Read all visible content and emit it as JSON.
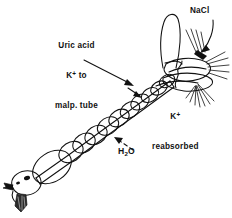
{
  "figure": {
    "background_color": "#ffffff",
    "ink_color": "#111111"
  },
  "labels": {
    "uric_acid": {
      "line1": "Uric acid",
      "line2_ion": "K",
      "line2_charge": "+",
      "line2_rest": " to",
      "line3": "malp. tube",
      "pointer": "solid-arrow"
    },
    "nacl": {
      "text": "NaCl",
      "pointer": "solid-arrow"
    },
    "k_reabsorbed": {
      "ion": "K",
      "charge": "+",
      "line2": "reabsorbed",
      "pointer": "squiggle-leader"
    },
    "water": {
      "formula_pre": "H",
      "formula_sub": "2",
      "formula_post": "O",
      "pointer": "dashed-arrow"
    }
  },
  "anatomy": {
    "parts": [
      "head",
      "mouthparts",
      "eye",
      "crop",
      "midgut-segments",
      "hindgut",
      "rectum",
      "malpighian-tubule-loop",
      "anal-bristles"
    ]
  }
}
